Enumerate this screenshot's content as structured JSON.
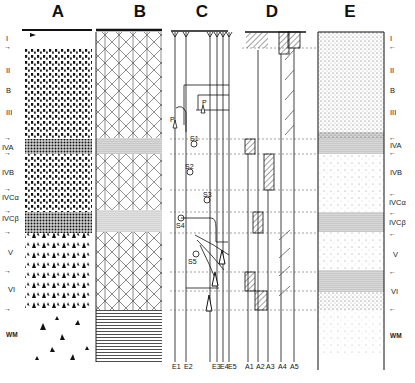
{
  "panels": {
    "A": {
      "title": "A"
    },
    "B": {
      "title": "B"
    },
    "C": {
      "title": "C"
    },
    "D": {
      "title": "D"
    },
    "E": {
      "title": "E"
    }
  },
  "left_layers": [
    {
      "label": "I",
      "y": 38
    },
    {
      "label": "II",
      "y": 70
    },
    {
      "label": "B",
      "y": 90
    },
    {
      "label": "III",
      "y": 112
    },
    {
      "label": "IVA",
      "y": 147
    },
    {
      "label": "IVB",
      "y": 172
    },
    {
      "label": "IVCα",
      "y": 197
    },
    {
      "label": "IVCβ",
      "y": 218
    },
    {
      "label": "V",
      "y": 252
    },
    {
      "label": "VI",
      "y": 289
    },
    {
      "label": "WM",
      "y": 335
    }
  ],
  "right_layers": [
    {
      "label": "I",
      "y": 38
    },
    {
      "label": "II",
      "y": 70
    },
    {
      "label": "B",
      "y": 90
    },
    {
      "label": "III",
      "y": 112
    },
    {
      "label": "IVA",
      "y": 145
    },
    {
      "label": "IVB",
      "y": 172
    },
    {
      "label": "IVCα",
      "y": 202
    },
    {
      "label": "IVCβ",
      "y": 222
    },
    {
      "label": "V",
      "y": 254
    },
    {
      "label": "VI",
      "y": 291
    },
    {
      "label": "WM",
      "y": 336
    }
  ],
  "boundary_ticks_y": [
    48,
    139,
    154,
    190,
    212,
    233,
    272,
    291,
    310
  ],
  "panel_C": {
    "neurons": [
      {
        "label": "P",
        "y": 125
      },
      {
        "label": "S1",
        "y": 142
      },
      {
        "label": "S2",
        "y": 158
      },
      {
        "label": "S3",
        "y": 175
      },
      {
        "label": "S4",
        "y": 222
      },
      {
        "label": "S5",
        "y": 248
      },
      {
        "label": "P",
        "y": 104
      }
    ],
    "bottom_labels": [
      "E1",
      "E2",
      "E3",
      "E4",
      "E5"
    ]
  },
  "panel_D": {
    "bottom_labels": [
      "A1",
      "A2",
      "A3",
      "A4",
      "A5"
    ]
  }
}
